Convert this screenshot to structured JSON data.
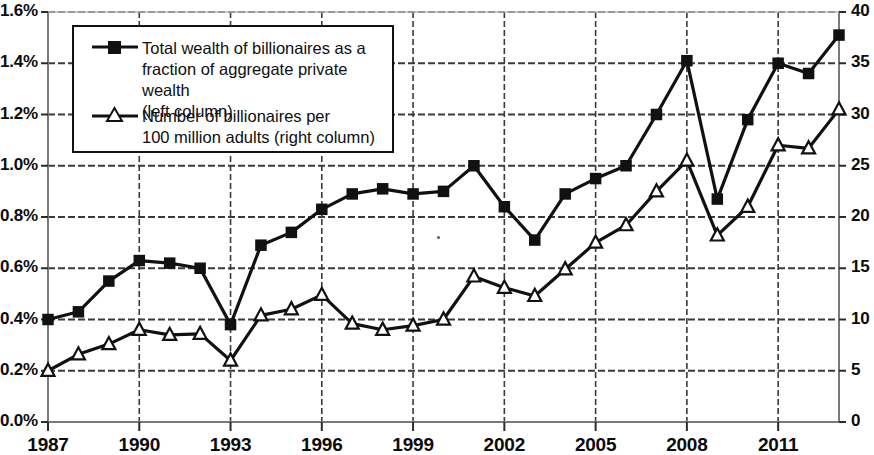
{
  "chart_data": {
    "type": "line",
    "title": "",
    "xlabel": "",
    "ylabel": "",
    "y2label": "",
    "grid": true,
    "legend_position": "top-left",
    "x": [
      1987,
      1988,
      1989,
      1990,
      1991,
      1992,
      1993,
      1994,
      1995,
      1996,
      1997,
      1998,
      1999,
      2000,
      2001,
      2002,
      2003,
      2004,
      2005,
      2006,
      2007,
      2008,
      2009,
      2010,
      2011,
      2012,
      2013
    ],
    "xtick_labels": [
      "1987",
      "1990",
      "1993",
      "1996",
      "1999",
      "2002",
      "2005",
      "2008",
      "2011"
    ],
    "xtick_values": [
      1987,
      1990,
      1993,
      1996,
      1999,
      2002,
      2005,
      2008,
      2011
    ],
    "xlim": [
      1987,
      2013
    ],
    "left_axis": {
      "tick_labels": [
        "0.0%",
        "0.2%",
        "0.4%",
        "0.6%",
        "0.8%",
        "1.0%",
        "1.2%",
        "1.4%",
        "1.6%"
      ],
      "tick_values": [
        0.0,
        0.2,
        0.4,
        0.6,
        0.8,
        1.0,
        1.2,
        1.4,
        1.6
      ],
      "ylim": [
        0.0,
        1.6
      ]
    },
    "right_axis": {
      "tick_labels": [
        "0",
        "5",
        "10",
        "15",
        "20",
        "25",
        "30",
        "35",
        "40"
      ],
      "tick_values": [
        0,
        5,
        10,
        15,
        20,
        25,
        30,
        35,
        40
      ],
      "ylim": [
        0,
        40
      ]
    },
    "series": [
      {
        "name": "Total wealth of billionaires as a fraction of aggregate private wealth (left column)",
        "axis": "left",
        "marker": "filled-square",
        "color": "#111111",
        "values": [
          0.4,
          0.43,
          0.55,
          0.63,
          0.62,
          0.6,
          0.38,
          0.69,
          0.74,
          0.83,
          0.89,
          0.91,
          0.89,
          0.9,
          1.0,
          0.84,
          0.71,
          0.89,
          0.95,
          1.0,
          1.2,
          1.41,
          0.87,
          1.18,
          1.4,
          1.36,
          1.51
        ]
      },
      {
        "name": "Number of billionaires per 100 million adults (right column)",
        "axis": "right",
        "marker": "open-triangle",
        "color": "#111111",
        "values": [
          5.0,
          6.6,
          7.6,
          9.0,
          8.5,
          8.6,
          6.0,
          10.4,
          11.0,
          12.4,
          9.6,
          9.0,
          9.4,
          10.0,
          14.2,
          13.1,
          12.3,
          14.9,
          17.5,
          19.2,
          22.5,
          25.5,
          18.2,
          21.0,
          27.0,
          26.7,
          30.5
        ]
      }
    ],
    "legend": [
      {
        "marker": "filled-square",
        "label": "Total wealth of billionaires as a\nfraction of aggregate private wealth\n(left column)"
      },
      {
        "marker": "open-triangle",
        "label": "Number of billionaires per\n100 million adults (right column)"
      }
    ]
  },
  "colors": {
    "line": "#111111",
    "grid": "#3a3a3a",
    "axis": "#7a7a7a",
    "background": "#ffffff",
    "text": "#0b0b0b"
  }
}
